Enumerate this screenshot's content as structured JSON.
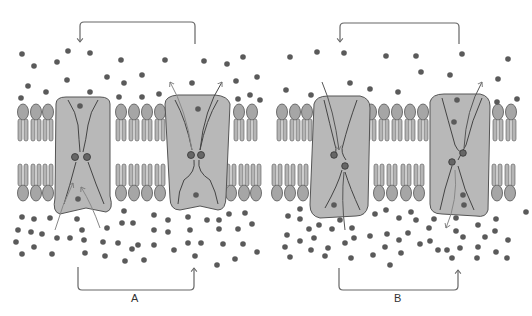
{
  "figure": {
    "colors": {
      "protein_fill": "#b8b8b8",
      "protein_stroke": "#555555",
      "lipid_head": "#a6a6a6",
      "lipid_tail": "#a8a8a8",
      "particle": "#5a5a5a",
      "bracket": "#666666",
      "arrow": "#777777"
    }
  },
  "panels": [
    {
      "id": "A",
      "label": "A",
      "top_bracket": {
        "x1": 80,
        "x2": 195,
        "y": 22,
        "arrow_end": "left",
        "arrow_direction": "down"
      },
      "bottom_bracket": {
        "x1": 78,
        "x2": 194,
        "y": 290,
        "arrow_end": "right",
        "arrow_direction": "up"
      },
      "channels": [
        {
          "name": "channel-a1",
          "state": "open toward inside (lower), gate closed above",
          "x": 56,
          "width": 60
        },
        {
          "name": "channel-a2",
          "state": "open toward outside (upper), gate closed below",
          "x": 165,
          "width": 60
        }
      ]
    },
    {
      "id": "B",
      "label": "B",
      "top_bracket": {
        "x1": 340,
        "x2": 459,
        "y": 22,
        "arrow_end": "left",
        "arrow_direction": "down"
      },
      "bottom_bracket": {
        "x1": 339,
        "x2": 458,
        "y": 290,
        "arrow_end": "right",
        "arrow_direction": "up"
      },
      "channels": [
        {
          "name": "channel-b1",
          "state": "particle moving inward through channel",
          "x": 312,
          "width": 58
        },
        {
          "name": "channel-b2",
          "state": "particle moving outward through channel",
          "x": 430,
          "width": 60
        }
      ]
    }
  ]
}
